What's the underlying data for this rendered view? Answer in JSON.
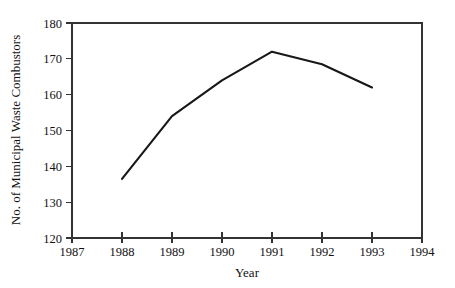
{
  "chart_data": {
    "type": "line",
    "title": "",
    "xlabel": "Year",
    "ylabel": "No. of Municipal Waste Combustors",
    "x": [
      1988,
      1989,
      1990,
      1991,
      1992,
      1993
    ],
    "values": [
      136.5,
      154,
      164,
      172,
      168.5,
      162
    ],
    "series": [
      {
        "name": "No. of Municipal Waste Combustors",
        "values": [
          136.5,
          154,
          164,
          172,
          168.5,
          162
        ]
      }
    ],
    "xlim": [
      1987,
      1994
    ],
    "ylim": [
      120,
      180
    ],
    "x_ticks": [
      1987,
      1988,
      1989,
      1990,
      1991,
      1992,
      1993,
      1994
    ],
    "x_tick_labels": [
      "1987",
      "1988",
      "1989",
      "1990",
      "1991",
      "1992",
      "1993",
      "1994"
    ],
    "y_ticks": [
      120,
      130,
      140,
      150,
      160,
      170,
      180
    ],
    "y_tick_labels": [
      "120",
      "130",
      "140",
      "150",
      "160",
      "170",
      "180"
    ],
    "grid": false,
    "legend": "none",
    "line_color": "#181818",
    "axis_color": "#333333",
    "background_color": "#ffffff"
  },
  "axis": {
    "x_title": "Year",
    "y_title": "No. of Municipal Waste Combustors"
  },
  "ticks": {
    "y": {
      "t0": "180",
      "t1": "170",
      "t2": "160",
      "t3": "150",
      "t4": "140",
      "t5": "130",
      "t6": "120"
    },
    "x": {
      "t0": "1987",
      "t1": "1988",
      "t2": "1989",
      "t3": "1990",
      "t4": "1991",
      "t5": "1992",
      "t6": "1993",
      "t7": "1994"
    }
  }
}
